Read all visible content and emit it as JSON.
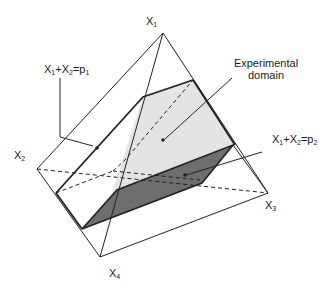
{
  "diagram": {
    "type": "simplex-mixture-region",
    "vertices": [
      {
        "id": "X1",
        "label": "X",
        "sub": "1",
        "x": 163,
        "y": 33
      },
      {
        "id": "X2",
        "label": "X",
        "sub": "2",
        "x": 37,
        "y": 169
      },
      {
        "id": "X3",
        "label": "X",
        "sub": "3",
        "x": 268,
        "y": 193
      },
      {
        "id": "X4",
        "label": "X",
        "sub": "4",
        "x": 100,
        "y": 257
      }
    ],
    "annotations": {
      "region_label_line1": "Experimental",
      "region_label_line2": "domain",
      "plane1": {
        "a": "X",
        "a_sub": "1",
        "plus": "+",
        "b": "X",
        "b_sub": "2",
        "eq": "=p",
        "p_sub": "1"
      },
      "plane2": {
        "a": "X",
        "a_sub": "1",
        "plus": "+",
        "b": "X",
        "b_sub": "2",
        "eq": "=p",
        "p_sub": "2"
      }
    },
    "colors": {
      "line": "#222222",
      "region_fill": "#e6e6e6",
      "plane_fill": "#6b6b6b",
      "background": "#ffffff"
    }
  }
}
